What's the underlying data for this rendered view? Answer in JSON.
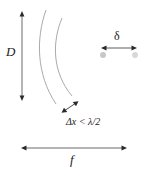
{
  "figure": {
    "background_color": "#ffffff",
    "line_color": "#4a4a4a",
    "arc_color": "#8a8a8a",
    "dot_color": "#bfbfbf",
    "text_color": "#1a1a1a",
    "labels": {
      "aperture": "D",
      "spot_size": "δ",
      "spacing_condition": "Δx < λ/2",
      "focal_length": "f"
    },
    "annotations": [
      {
        "name": "aperture-arrow",
        "label": "D",
        "orientation": "vertical",
        "double_headed": true,
        "x": 22,
        "y1": 12,
        "y2": 100
      },
      {
        "name": "spot-size-arrow",
        "label": "δ",
        "orientation": "horizontal",
        "double_headed": true,
        "y": 48,
        "x1": 102,
        "x2": 136
      },
      {
        "name": "element-spacing-arrow",
        "label": "Δx < λ/2",
        "orientation": "diagonal",
        "double_headed": true,
        "x1": 62,
        "y1": 113,
        "x2": 78,
        "y2": 101
      },
      {
        "name": "focal-length-arrow",
        "label": "f",
        "orientation": "horizontal",
        "double_headed": true,
        "y": 148,
        "x1": 22,
        "x2": 126
      }
    ],
    "arcs": [
      {
        "name": "wavefront-arc-outer",
        "start": [
          46,
          10
        ],
        "end": [
          56,
          104
        ]
      },
      {
        "name": "wavefront-arc-inner",
        "start": [
          62,
          18
        ],
        "end": [
          72,
          96
        ]
      }
    ],
    "focal_dots": [
      {
        "name": "focal-dot-left",
        "cx": 103,
        "cy": 55,
        "r": 3
      },
      {
        "name": "focal-dot-right",
        "cx": 135,
        "cy": 55,
        "r": 3
      }
    ]
  }
}
